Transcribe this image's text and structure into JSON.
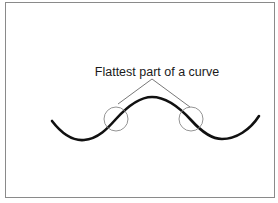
{
  "diagram": {
    "annotation_label": "Flattest part of a curve",
    "colors": {
      "frame": "#8a8a8a",
      "curve": "#111111",
      "leader": "#555555",
      "circle": "#888888",
      "text": "#1a1a1a"
    },
    "highlighted_regions": [
      {
        "name": "left-inflection-point"
      },
      {
        "name": "right-inflection-point"
      }
    ]
  }
}
